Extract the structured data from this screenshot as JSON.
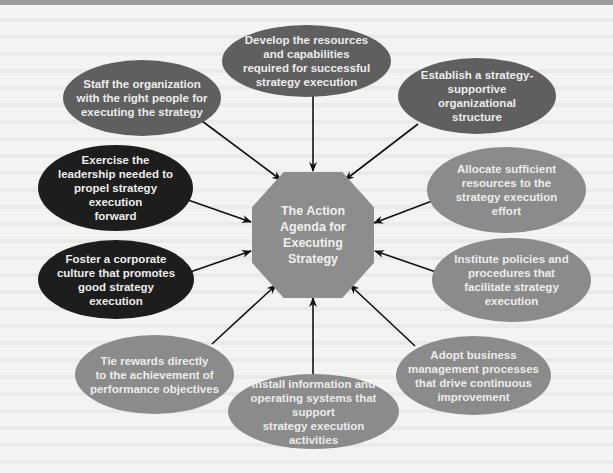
{
  "diagram": {
    "type": "hub-and-spoke",
    "center": {
      "label": "The Action Agenda for Executing Strategy",
      "shape": "octagon",
      "color": "#8d8d8d"
    },
    "colors": {
      "dark": "#5f5f5f",
      "black": "#1d1d1d",
      "medium": "#8b8b8b",
      "arrow": "#111111",
      "background": "#f3f3f2",
      "top_bar": "#9c9c9c"
    },
    "nodes": [
      {
        "id": "develop",
        "label": "Develop the resources and capabilities required for successful strategy execution",
        "tone": "dark"
      },
      {
        "id": "establish",
        "label": "Establish a strategy-supportive organizational structure",
        "tone": "dark"
      },
      {
        "id": "allocate",
        "label": "Allocate sufficient resources to the strategy execution effort",
        "tone": "medium"
      },
      {
        "id": "institute",
        "label": "Institute policies and procedures that facilitate strategy execution",
        "tone": "medium"
      },
      {
        "id": "adopt",
        "label": "Adopt business management processes that drive continuous improvement",
        "tone": "medium"
      },
      {
        "id": "install",
        "label": "Install information and operating systems that support strategy execution activities",
        "tone": "medium"
      },
      {
        "id": "tie-rewards",
        "label": "Tie rewards directly to the achievement of performance objectives",
        "tone": "medium"
      },
      {
        "id": "foster",
        "label": "Foster a corporate culture that promotes good strategy execution",
        "tone": "black"
      },
      {
        "id": "exercise",
        "label": "Exercise the leadership needed to propel strategy execution forward",
        "tone": "black"
      },
      {
        "id": "staff",
        "label": "Staff the organization with the right people for executing the strategy",
        "tone": "dark"
      }
    ],
    "edges": [
      {
        "from": "develop",
        "to": "center"
      },
      {
        "from": "establish",
        "to": "center"
      },
      {
        "from": "allocate",
        "to": "center"
      },
      {
        "from": "institute",
        "to": "center"
      },
      {
        "from": "adopt",
        "to": "center"
      },
      {
        "from": "install",
        "to": "center"
      },
      {
        "from": "tie-rewards",
        "to": "center"
      },
      {
        "from": "foster",
        "to": "center"
      },
      {
        "from": "exercise",
        "to": "center"
      },
      {
        "from": "staff",
        "to": "center"
      }
    ]
  },
  "lines": {
    "develop": [
      "Develop the resources",
      "and capabilities",
      "required for successful",
      "strategy execution"
    ],
    "staff": [
      "Staff the organization",
      "with the right people for",
      "executing the strategy"
    ],
    "establish": [
      "Establish a strategy-",
      "supportive organizational",
      "structure"
    ],
    "exercise": [
      "Exercise the",
      "leadership needed to",
      "propel strategy execution",
      "forward"
    ],
    "allocate": [
      "Allocate sufficient",
      "resources to the",
      "strategy execution",
      "effort"
    ],
    "foster": [
      "Foster a corporate",
      "culture that promotes",
      "good strategy",
      "execution"
    ],
    "institute": [
      "Institute policies and",
      "procedures that",
      "facilitate strategy",
      "execution"
    ],
    "tie_rewards": [
      "Tie rewards directly",
      "to the achievement of",
      "performance objectives"
    ],
    "adopt": [
      "Adopt business",
      "management processes",
      "that drive continuous",
      "improvement"
    ],
    "install": [
      "Install information and",
      "operating systems that support",
      "strategy execution activities"
    ],
    "center": [
      "The Action",
      "Agenda for",
      "Executing",
      "Strategy"
    ]
  }
}
